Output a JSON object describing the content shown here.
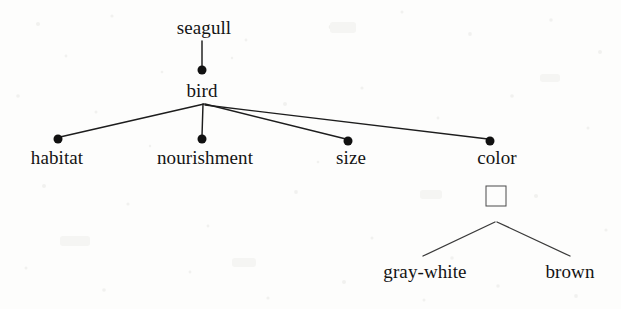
{
  "diagram": {
    "kind": "semantic-feature-tree",
    "root_label": "seagull",
    "background_color": "#fdfdfc",
    "ink_color": "#141414",
    "nodes": [
      {
        "id": "seagull",
        "label": "seagull",
        "marker": "none",
        "x": 204,
        "y": 33,
        "label_x": 204,
        "label_y": 18
      },
      {
        "id": "bird",
        "label": "bird",
        "marker": "dot",
        "x": 202,
        "y": 70,
        "label_x": 202,
        "label_y": 81
      },
      {
        "id": "habitat",
        "label": "habitat",
        "marker": "dot",
        "x": 58,
        "y": 139,
        "label_x": 57,
        "label_y": 148
      },
      {
        "id": "nourishment",
        "label": "nourishment",
        "marker": "dot",
        "x": 202,
        "y": 139,
        "label_x": 205,
        "label_y": 148
      },
      {
        "id": "size",
        "label": "size",
        "marker": "dot",
        "x": 348,
        "y": 141,
        "label_x": 351,
        "label_y": 148
      },
      {
        "id": "color",
        "label": "color",
        "marker": "dot",
        "x": 490,
        "y": 141,
        "label_x": 497,
        "label_y": 148
      },
      {
        "id": "color-slot",
        "label": "",
        "marker": "square",
        "x": 496,
        "y": 196,
        "label_x": 496,
        "label_y": 196
      },
      {
        "id": "gray-white",
        "label": "gray-white",
        "marker": "none",
        "x": 425,
        "y": 262,
        "label_x": 425,
        "label_y": 262
      },
      {
        "id": "brown",
        "label": "brown",
        "marker": "none",
        "x": 570,
        "y": 262,
        "label_x": 570,
        "label_y": 262
      }
    ],
    "edges": [
      {
        "id": "seagull-bird",
        "from": "seagull",
        "to": "bird",
        "x1": 202,
        "y1": 41,
        "x2": 202,
        "y2": 67
      },
      {
        "id": "bird-habitat",
        "from": "bird",
        "to": "habitat",
        "x1": 204,
        "y1": 104,
        "x2": 60,
        "y2": 137
      },
      {
        "id": "bird-nourishment",
        "from": "bird",
        "to": "nourishment",
        "x1": 203,
        "y1": 104,
        "x2": 202,
        "y2": 136
      },
      {
        "id": "bird-size",
        "from": "bird",
        "to": "size",
        "x1": 205,
        "y1": 104,
        "x2": 346,
        "y2": 139
      },
      {
        "id": "bird-color",
        "from": "bird",
        "to": "color",
        "x1": 205,
        "y1": 105,
        "x2": 488,
        "y2": 139
      },
      {
        "id": "slot-gray-white",
        "from": "color-slot",
        "to": "gray-white",
        "x1": 495,
        "y1": 222,
        "x2": 423,
        "y2": 256
      },
      {
        "id": "slot-brown",
        "from": "color-slot",
        "to": "brown",
        "x1": 497,
        "y1": 222,
        "x2": 570,
        "y2": 256
      }
    ]
  }
}
